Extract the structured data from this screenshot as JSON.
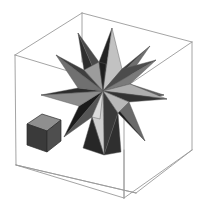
{
  "figure": {
    "title": "Stellated polyhedron in wireframe bounding box",
    "background_color": "#ffffff",
    "canvas": {
      "width": 203,
      "height": 203
    }
  },
  "colors": {
    "background": "#ffffff",
    "wireframe_stroke": "#9a9a9a",
    "facet_stroke": "#5c5c5c",
    "cube_stroke": "#2b2b2b",
    "gray_darkest": "#1c1c1c",
    "gray_dark": "#333333",
    "gray_mid_dark": "#4a4a4a",
    "gray_mid": "#636363",
    "gray_mid_light": "#7d7d7d",
    "gray_light": "#9b9b9b",
    "gray_lighter": "#b4b4b4",
    "gray_lightest": "#c9c9c9",
    "cube_top": "#8f8f8f",
    "cube_left": "#3a3a3a",
    "cube_front": "#474747"
  },
  "objects": {
    "bounding_box": {
      "name": "wireframe-cube",
      "edge_count": 12,
      "stroke_color": "#9a9a9a",
      "vertices": {
        "back_top_left": [
          15,
          55
        ],
        "top_apex": [
          82,
          13
        ],
        "back_top_right": [
          192,
          42
        ],
        "front_top": [
          124,
          88
        ],
        "front_bottom_left": [
          16,
          165
        ],
        "front_bottom_mid": [
          136,
          193
        ],
        "back_bottom_right": [
          192,
          150
        ],
        "hidden_back_bottom": [
          124,
          198
        ]
      }
    },
    "stellated_polyhedron": {
      "name": "small-stellated-dodecahedron",
      "center": [
        103,
        91
      ],
      "spike_count": 12,
      "visible_spike_count": 9,
      "outer_radius": 62,
      "inner_radius": 27,
      "shading": "alternating light and dark gray triangular facets"
    },
    "reference_cube": {
      "name": "small-scale-cube",
      "position": [
        27,
        115
      ],
      "size": 33,
      "top_face_color": "#8f8f8f",
      "left_face_color": "#3a3a3a",
      "front_face_color": "#474747"
    }
  },
  "labels": {
    "none_visible": true
  }
}
